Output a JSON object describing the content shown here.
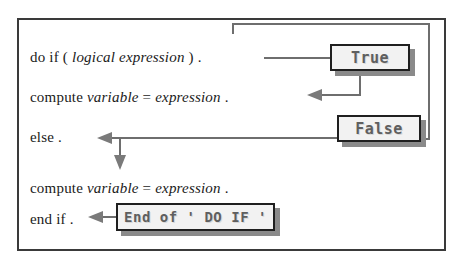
{
  "diagram": {
    "frame": {
      "border_color": "#3a3a3a"
    },
    "statements": [
      {
        "id": "do-if",
        "parts": [
          {
            "text": "do if ( ",
            "style": "roman"
          },
          {
            "text": "logical expression",
            "style": "italic"
          },
          {
            "text": " ) .",
            "style": "roman"
          }
        ],
        "plain": "do if ( logical expression ) ."
      },
      {
        "id": "compute-true-branch",
        "parts": [
          {
            "text": "compute ",
            "style": "roman"
          },
          {
            "text": "variable",
            "style": "italic"
          },
          {
            "text": " = ",
            "style": "roman"
          },
          {
            "text": "expression",
            "style": "italic"
          },
          {
            "text": " .",
            "style": "roman"
          }
        ],
        "plain": "compute variable = expression ."
      },
      {
        "id": "else",
        "parts": [
          {
            "text": "else .",
            "style": "roman"
          }
        ],
        "plain": "else ."
      },
      {
        "id": "compute-false-branch",
        "parts": [
          {
            "text": "compute ",
            "style": "roman"
          },
          {
            "text": "variable",
            "style": "italic"
          },
          {
            "text": " = ",
            "style": "roman"
          },
          {
            "text": "expression",
            "style": "italic"
          },
          {
            "text": " .",
            "style": "roman"
          }
        ],
        "plain": "compute variable = expression ."
      },
      {
        "id": "end-if",
        "parts": [
          {
            "text": "end if .",
            "style": "roman"
          }
        ],
        "plain": "end if ."
      }
    ],
    "labels": {
      "true_box": "True",
      "false_box": "False",
      "end_box": "End of ' DO IF '"
    },
    "colors": {
      "connector": "#6e6e6e",
      "arrow": "#7a7a7a",
      "box_border": "#1f1f1f",
      "box_fill": "#f2f2f2",
      "box_shadow": "#8a8a8a",
      "text": "#1a1a1a",
      "label_text": "#5f5f5f"
    }
  }
}
